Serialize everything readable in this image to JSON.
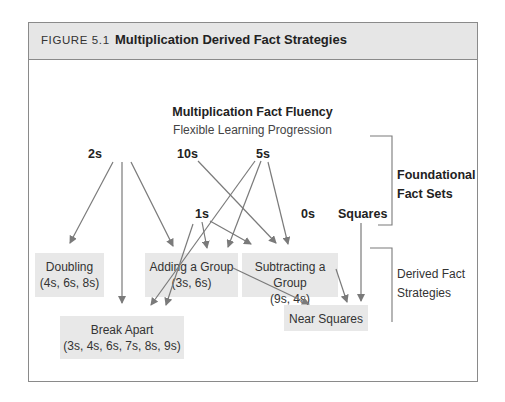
{
  "figure": {
    "number": "FIGURE 5.1",
    "title": "Multiplication Derived Fact Strategies"
  },
  "diagram": {
    "title": "Multiplication Fact Fluency",
    "subtitle": "Flexible Learning Progression",
    "foundational_sets": [
      "2s",
      "10s",
      "5s",
      "1s",
      "0s",
      "Squares"
    ],
    "strategies": [
      {
        "name": "Doubling",
        "facts": "(4s, 6s, 8s)"
      },
      {
        "name": "Adding a Group",
        "facts": "(3s, 6s)"
      },
      {
        "name": "Subtracting a Group",
        "facts": "(9s, 4s)"
      },
      {
        "name": "Break Apart",
        "facts": "(3s, 4s, 6s, 7s, 8s, 9s)"
      },
      {
        "name": "Near Squares",
        "facts": ""
      }
    ],
    "brackets": {
      "foundational_line1": "Foundational",
      "foundational_line2": "Fact Sets",
      "derived_line1": "Derived Fact",
      "derived_line2": "Strategies"
    },
    "edges": [
      {
        "from": "2s",
        "to": "Doubling"
      },
      {
        "from": "2s",
        "to": "Break Apart"
      },
      {
        "from": "2s",
        "to": "Adding a Group"
      },
      {
        "from": "10s",
        "to": "Subtracting a Group"
      },
      {
        "from": "5s",
        "to": "Break Apart"
      },
      {
        "from": "5s",
        "to": "Adding a Group"
      },
      {
        "from": "5s",
        "to": "Subtracting a Group"
      },
      {
        "from": "1s",
        "to": "Break Apart"
      },
      {
        "from": "1s",
        "to": "Adding a Group"
      },
      {
        "from": "1s",
        "to": "Subtracting a Group"
      },
      {
        "from": "Squares",
        "to": "Near Squares"
      },
      {
        "from": "Adding a Group",
        "to": "Near Squares"
      },
      {
        "from": "Subtracting a Group",
        "to": "Near Squares"
      }
    ]
  },
  "colors": {
    "header_bg": "#e6e6e6",
    "box_bg": "#e8e8e8",
    "arrow": "#7a7a7a",
    "border": "#8a8a8a"
  }
}
